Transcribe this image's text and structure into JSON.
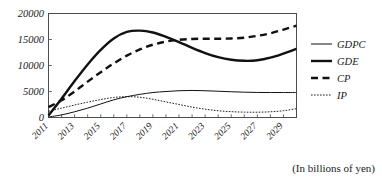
{
  "caption": "(In billions of yen)",
  "chart_data": {
    "type": "line",
    "title": "",
    "subtitle": "",
    "xlabel": "",
    "ylabel": "",
    "unit_note": "(In billions of yen)",
    "grid": false,
    "legend_position": "right",
    "xlim": [
      2011,
      2030
    ],
    "ylim": [
      0,
      20000
    ],
    "ytick_labels": [
      "20000",
      "15000",
      "10000",
      "5000",
      "0"
    ],
    "ytick_values": [
      20000,
      15000,
      10000,
      5000,
      0
    ],
    "xtick_labels": [
      "2011",
      "2013",
      "2015",
      "2017",
      "2019",
      "2021",
      "2023",
      "2025",
      "2027",
      "2029"
    ],
    "xtick_values": [
      2011,
      2013,
      2015,
      2017,
      2019,
      2021,
      2023,
      2025,
      2027,
      2029
    ],
    "x": [
      2011,
      2012,
      2013,
      2014,
      2015,
      2016,
      2017,
      2018,
      2019,
      2020,
      2021,
      2022,
      2023,
      2024,
      2025,
      2026,
      2027,
      2028,
      2029,
      2030
    ],
    "series": [
      {
        "name": "GDPC",
        "style": "thin-solid",
        "values": [
          100,
          500,
          1100,
          1800,
          2600,
          3400,
          4000,
          4450,
          4800,
          5000,
          5150,
          5200,
          5150,
          5050,
          4950,
          4870,
          4820,
          4800,
          4800,
          4800
        ]
      },
      {
        "name": "GDE",
        "style": "thick-solid",
        "values": [
          400,
          3600,
          7000,
          10200,
          13000,
          15200,
          16450,
          16700,
          16350,
          15500,
          14500,
          13400,
          12400,
          11600,
          11100,
          10900,
          11000,
          11500,
          12300,
          13200
        ]
      },
      {
        "name": "CP",
        "style": "thick-dashed",
        "values": [
          2000,
          3300,
          5000,
          6900,
          8700,
          10400,
          11900,
          13100,
          14000,
          14600,
          14950,
          15100,
          15150,
          15150,
          15200,
          15350,
          15700,
          16200,
          16900,
          17650
        ]
      },
      {
        "name": "IP",
        "style": "thin-dotted",
        "values": [
          1200,
          1800,
          2400,
          2950,
          3450,
          3850,
          4000,
          3900,
          3500,
          3000,
          2500,
          2000,
          1600,
          1300,
          1120,
          1030,
          1020,
          1100,
          1300,
          1700
        ]
      }
    ]
  },
  "legend": {
    "items": [
      {
        "label": "GDPC",
        "style": "thin-solid"
      },
      {
        "label": "GDE",
        "style": "thick-solid"
      },
      {
        "label": "CP",
        "style": "thick-dashed"
      },
      {
        "label": "IP",
        "style": "thin-dotted"
      }
    ]
  }
}
